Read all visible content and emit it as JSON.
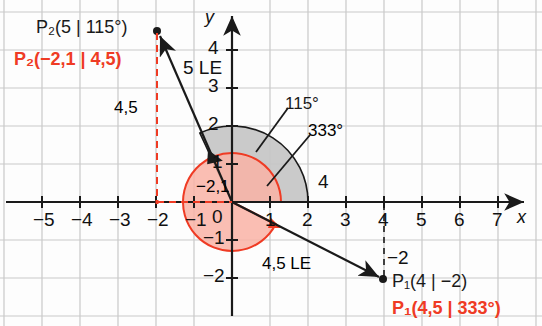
{
  "figure": {
    "type": "coordinate-plane-polar-diagram",
    "background_color": "#fdfdfd",
    "grid_color": "#c9c9c9",
    "axis_color": "#1a1a1a",
    "accent_color": "#ef3b24",
    "gray_fill": "#c6c6c6"
  },
  "axes": {
    "x_label": "x",
    "y_label": "y",
    "origin_label": "0",
    "x_ticks": [
      "−5",
      "−4",
      "−3",
      "−2",
      "−1",
      "1",
      "2",
      "3",
      "4",
      "5",
      "6",
      "7"
    ],
    "y_ticks": [
      "4",
      "3",
      "2",
      "1",
      "−1",
      "−2"
    ],
    "x_range": [
      -6,
      8
    ],
    "y_range": [
      -3,
      5
    ],
    "unit_px": 38
  },
  "points": [
    {
      "name": "P2",
      "cartesian_label": "P₂(5 | 115°)",
      "polar_label": "P₂(−2,1 | 4,5)",
      "x": -2.1,
      "y": 4.5,
      "radius": 5,
      "angle_deg": 115
    },
    {
      "name": "P1",
      "cartesian_label": "P₁(4 | −2)",
      "polar_label": "P₁(4,5 | 333°)",
      "x": 4,
      "y": -2,
      "radius": 4.5,
      "angle_deg": 333
    }
  ],
  "annotations": {
    "length_p2": "5 LE",
    "length_p1": "4,5 LE",
    "drop_y_p2": "4,5",
    "coord_x_p2": "−2,1",
    "angle_gray": "115°",
    "angle_red": "333°",
    "radius_gray_label": "4",
    "tick_minus2_dashed": "−2"
  },
  "arcs": [
    {
      "name": "angle-115-arc",
      "start_deg": 0,
      "end_deg": 115,
      "radius_units": 2.0,
      "fill": "#c6c6c6",
      "stroke": "#1a1a1a"
    },
    {
      "name": "angle-333-arc",
      "start_deg": 0,
      "end_deg": 333,
      "radius_units": 1.3,
      "fill": "#f9b3a6",
      "stroke": "#ef3b24"
    }
  ]
}
